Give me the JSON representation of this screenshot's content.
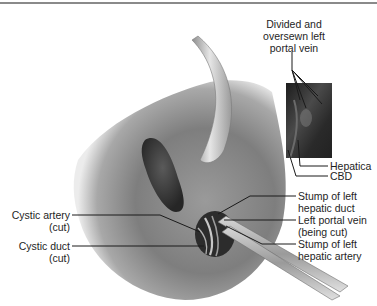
{
  "figure": {
    "type": "surgical illustration"
  },
  "labels": {
    "divided_portal_vein": {
      "line1": "Divided and",
      "line2": "oversewn left",
      "line3": "portal vein"
    },
    "hepatica": "Hepatica",
    "cbd": "CBD",
    "stump_hepatic_duct": {
      "line1": "Stump of left",
      "line2": "hepatic duct"
    },
    "left_portal_vein_cut": {
      "line1": "Left portal vein",
      "line2": "(being cut)"
    },
    "stump_hepatic_artery": {
      "line1": "Stump of left",
      "line2": "hepatic artery"
    },
    "cystic_artery": {
      "line1": "Cystic artery",
      "line2": "(cut)"
    },
    "cystic_duct": {
      "line1": "Cystic duct",
      "line2": "(cut)"
    }
  },
  "colors": {
    "background": "#ffffff",
    "liver": "#8c8c8c",
    "retractor": "#bdbdbd",
    "gallbladder_fossa": "#3a3a3a",
    "inset_bg": "#2a2a2a",
    "leader_line": "#1a1a1a",
    "top_rule": "#8a8a8a"
  }
}
